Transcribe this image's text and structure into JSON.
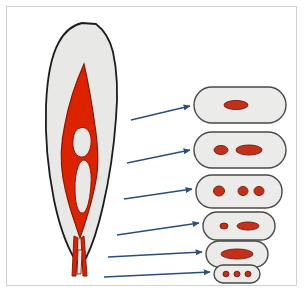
{
  "figure": {
    "background_color": "#ffffff",
    "frame": {
      "border_color": "#cfcfcf",
      "x": 6,
      "y": 6,
      "width": 291,
      "height": 280
    },
    "colors": {
      "leaf_fill": "#e8e8e6",
      "leaf_stroke": "#1c1c1c",
      "vein_fill": "#dd2200",
      "vein_stroke": "#8c1606",
      "section_fill": "#ebebe9",
      "section_stroke": "#4a4a4a",
      "spot_fill": "#c4301a",
      "spot_stroke": "#7e2211",
      "arrow_color": "#2b4f7a"
    }
  },
  "leaf": {
    "name": "leaf-blade",
    "outline_path": "M 96 24 C 104 30 110 40 113 52 C 117 70 118 94 116 118 C 114 146 110 176 103 206 C 98 228 92 246 86 258 L 80 266 L 74 258 C 66 244 59 224 54 200 C 48 170 45 136 46 106 C 47 80 51 56 59 42 C 65 31 73 25 82 23 Z",
    "midrib_path": "M 84 64 C 88 82 92 104 95 126 C 98 146 99 164 96 180 C 93 198 88 214 84 226 L 80 238 L 76 226 C 71 212 66 196 63 178 C 60 160 61 142 65 124 C 69 102 76 82 84 64 Z",
    "lacuna_upper_path": "M 80 128 C 85 126 90 130 91 138 C 92 148 88 156 83 157 C 76 158 72 150 73 140 C 74 132 76 129 80 128 Z",
    "lacuna_lower_path": "M 84 160 C 89 161 92 170 91 184 C 90 200 87 212 83 213 C 78 214 75 204 75 188 C 75 172 79 160 84 160 Z",
    "petiole_left_path": "M 74 236 L 72 276 L 76 276 L 78 238 Z",
    "petiole_right_path": "M 84 236 L 87 276 L 83 276 L 81 238 Z",
    "petiole_gap_path": "M 78 250 L 77 274 L 81 274 L 82 250 Z"
  },
  "sections": [
    {
      "id": "section-1",
      "label": "transverse-section-1",
      "x": 194,
      "y": 87,
      "width": 92,
      "height": 36,
      "radius": 18,
      "spots": [
        {
          "cx": 236,
          "cy": 105,
          "rx": 12,
          "ry": 4.5
        }
      ]
    },
    {
      "id": "section-2",
      "label": "transverse-section-2",
      "x": 194,
      "y": 132,
      "width": 92,
      "height": 36,
      "radius": 18,
      "spots": [
        {
          "cx": 221,
          "cy": 150,
          "rx": 7,
          "ry": 4.5
        },
        {
          "cx": 249,
          "cy": 150,
          "rx": 13,
          "ry": 5
        }
      ]
    },
    {
      "id": "section-3",
      "label": "transverse-section-3",
      "x": 196,
      "y": 175,
      "width": 86,
      "height": 33,
      "radius": 16,
      "spots": [
        {
          "cx": 219,
          "cy": 191,
          "rx": 5.5,
          "ry": 5
        },
        {
          "cx": 243,
          "cy": 191,
          "rx": 5,
          "ry": 4.5
        },
        {
          "cx": 259,
          "cy": 191,
          "rx": 5,
          "ry": 4.5
        }
      ]
    },
    {
      "id": "section-4",
      "label": "transverse-section-4",
      "x": 203,
      "y": 212,
      "width": 72,
      "height": 28,
      "radius": 14,
      "spots": [
        {
          "cx": 224,
          "cy": 226,
          "rx": 4,
          "ry": 3
        },
        {
          "cx": 248,
          "cy": 226,
          "rx": 11,
          "ry": 4
        }
      ]
    },
    {
      "id": "section-5",
      "label": "transverse-section-5",
      "x": 206,
      "y": 241,
      "width": 62,
      "height": 26,
      "radius": 13,
      "spots": [
        {
          "cx": 237,
          "cy": 254,
          "rx": 16,
          "ry": 5
        }
      ]
    },
    {
      "id": "section-6",
      "label": "transverse-section-6",
      "x": 214,
      "y": 265,
      "width": 46,
      "height": 18,
      "radius": 9,
      "spots": [
        {
          "cx": 226,
          "cy": 274,
          "rx": 3,
          "ry": 2.8
        },
        {
          "cx": 237,
          "cy": 274,
          "rx": 3,
          "ry": 2.8
        },
        {
          "cx": 248,
          "cy": 274,
          "rx": 3,
          "ry": 2.8
        }
      ]
    }
  ],
  "arrows": [
    {
      "id": "arrow-1",
      "label": "arrow-to-section-1",
      "x1": 131,
      "y1": 120,
      "x2": 190,
      "y2": 106
    },
    {
      "id": "arrow-2",
      "label": "arrow-to-section-2",
      "x1": 127,
      "y1": 163,
      "x2": 190,
      "y2": 150
    },
    {
      "id": "arrow-3",
      "label": "arrow-to-section-3",
      "x1": 124,
      "y1": 199,
      "x2": 192,
      "y2": 189
    },
    {
      "id": "arrow-4",
      "label": "arrow-to-section-4",
      "x1": 117,
      "y1": 235,
      "x2": 199,
      "y2": 223
    },
    {
      "id": "arrow-5",
      "label": "arrow-to-section-5",
      "x1": 108,
      "y1": 257,
      "x2": 202,
      "y2": 252
    },
    {
      "id": "arrow-6",
      "label": "arrow-to-section-6",
      "x1": 104,
      "y1": 277,
      "x2": 210,
      "y2": 272
    }
  ]
}
